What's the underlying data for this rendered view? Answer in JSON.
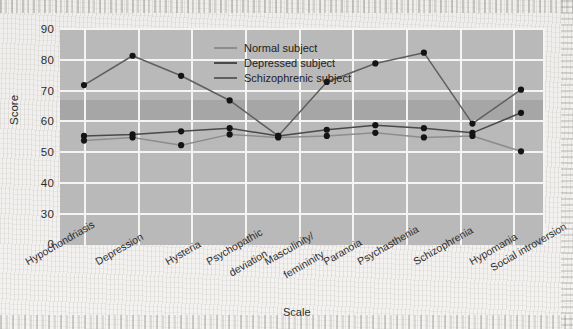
{
  "chart_data": {
    "type": "line",
    "title": "",
    "xlabel": "Scale",
    "ylabel": "Score",
    "categories": [
      "Hypochondriasis",
      "Depression",
      "Hysteria",
      "Psychopathic\ndeviation",
      "Masculinity/\nfemininity",
      "Paranoia",
      "Psychasthenia",
      "Schizophrenia",
      "Hypomania",
      "Social introversion"
    ],
    "yticks": [
      0,
      30,
      40,
      50,
      60,
      70,
      80,
      90
    ],
    "ylim": [
      0,
      90
    ],
    "axis_break": true,
    "grid": "both",
    "legend_position": "upper-center",
    "normal_band": [
      60,
      66
    ],
    "series": [
      {
        "name": "Normal subject",
        "color": "#8d8d8d",
        "values": [
          53.5,
          54.5,
          52.0,
          55.5,
          54.5,
          55.0,
          56.0,
          54.5,
          55.0,
          50.0
        ]
      },
      {
        "name": "Depressed subject",
        "color": "#4a4a4a",
        "values": [
          55.0,
          55.5,
          56.5,
          57.5,
          55.0,
          57.0,
          58.5,
          57.5,
          56.0,
          62.5
        ]
      },
      {
        "name": "Schizophrenic subject",
        "color": "#5f5f5f",
        "values": [
          71.5,
          81.0,
          74.5,
          66.5,
          55.0,
          72.5,
          78.5,
          82.0,
          59.0,
          70.0
        ]
      }
    ]
  },
  "legend": {
    "items": [
      {
        "label": "Normal subject",
        "color": "#8d8d8d"
      },
      {
        "label": "Depressed subject",
        "color": "#4a4a4a"
      },
      {
        "label": "Schizophrenic subject",
        "color": "#5f5f5f"
      }
    ]
  },
  "axes": {
    "y_title": "Score",
    "x_title": "Scale",
    "y_tick_labels": [
      "90",
      "80",
      "70",
      "60",
      "50",
      "40",
      "30",
      "0"
    ],
    "x_tick_labels": [
      "Hypochondriasis",
      "Depression",
      "Hysteria",
      "Psychopathic|deviation",
      "Masculinity/|femininity",
      "Paranoia",
      "Psychasthenia",
      "Schizophrenia",
      "Hypomania",
      "Social introversion"
    ]
  },
  "colors": {
    "plot_background": "#b9b9b9",
    "normal_band": "#a6a6a6",
    "gridline": "#f4f4f2",
    "marker": "#141414",
    "page_background": "#f2f1ef"
  }
}
